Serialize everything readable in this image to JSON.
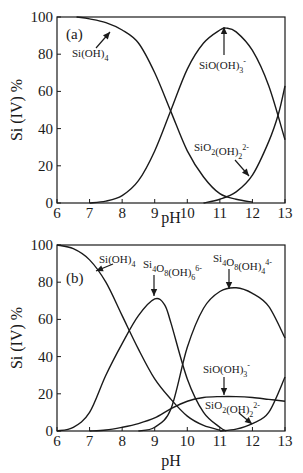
{
  "chart_data": [
    {
      "type": "line",
      "panel_label": "(a)",
      "xlabel": "pH",
      "ylabel": "Si (IV) %",
      "xlim": [
        6,
        13
      ],
      "ylim": [
        0,
        100
      ],
      "xticks": [
        "6",
        "7",
        "8",
        "9",
        "10",
        "11",
        "12",
        "13"
      ],
      "yticks": [
        "0",
        "20",
        "40",
        "60",
        "80",
        "100"
      ],
      "series": [
        {
          "name": "Si(OH)4",
          "label_parts": [
            [
              "Si(OH)",
              ""
            ],
            [
              "4",
              "sub"
            ]
          ],
          "x": [
            6.6,
            7,
            7.5,
            8,
            8.5,
            9,
            9.5,
            10,
            10.5,
            11,
            11.5,
            12
          ],
          "values": [
            100,
            99,
            97,
            93,
            86,
            70,
            49,
            28,
            14,
            5,
            2,
            0.5
          ]
        },
        {
          "name": "SiO(OH)3-",
          "label_parts": [
            [
              "SiO(OH)",
              ""
            ],
            [
              "3",
              "sub"
            ],
            [
              "-",
              "sup"
            ]
          ],
          "x": [
            7,
            7.5,
            8,
            8.5,
            9,
            9.5,
            10,
            10.5,
            11,
            11.2,
            11.5,
            12,
            12.5,
            13
          ],
          "values": [
            0,
            1,
            4,
            12,
            28,
            50,
            72,
            86,
            93,
            94,
            92,
            82,
            63,
            34
          ]
        },
        {
          "name": "SiO2(OH)2 2-",
          "label_parts": [
            [
              "SiO",
              ""
            ],
            [
              "2",
              "sub"
            ],
            [
              "(OH)",
              ""
            ],
            [
              "2",
              "sub"
            ],
            [
              "2-",
              "sup"
            ]
          ],
          "x": [
            10.5,
            11,
            11.5,
            12,
            12.5,
            12.8,
            13
          ],
          "values": [
            0,
            2,
            6,
            15,
            33,
            48,
            63
          ]
        }
      ]
    },
    {
      "type": "line",
      "panel_label": "(b)",
      "xlabel": "pH",
      "ylabel": "Si (IV) %",
      "xlim": [
        6,
        13
      ],
      "ylim": [
        0,
        100
      ],
      "xticks": [
        "6",
        "7",
        "8",
        "9",
        "10",
        "11",
        "12",
        "13"
      ],
      "yticks": [
        "0",
        "20",
        "40",
        "60",
        "80",
        "100"
      ],
      "series": [
        {
          "name": "Si(OH)4",
          "label_parts": [
            [
              "Si(OH)",
              ""
            ],
            [
              "4",
              "sub"
            ]
          ],
          "x": [
            6,
            6.5,
            7,
            7.5,
            8,
            8.5,
            9,
            9.5,
            10,
            10.5,
            11
          ],
          "values": [
            100,
            98,
            92,
            80,
            62,
            44,
            28,
            17,
            8,
            3,
            0.5
          ]
        },
        {
          "name": "Si4O8(OH)6 6-",
          "label_parts": [
            [
              "Si",
              ""
            ],
            [
              "4",
              "sub"
            ],
            [
              "O",
              ""
            ],
            [
              "8",
              "sub"
            ],
            [
              "(OH)",
              ""
            ],
            [
              "6",
              "sub"
            ],
            [
              "6-",
              "sup"
            ]
          ],
          "x": [
            6,
            6.5,
            7,
            7.5,
            8,
            8.5,
            9,
            9.3,
            9.5,
            10,
            10.5,
            11,
            11.2
          ],
          "values": [
            0,
            2,
            10,
            30,
            47,
            62,
            71,
            68,
            58,
            28,
            10,
            2,
            0
          ]
        },
        {
          "name": "Si4O8(OH)4 4-",
          "label_parts": [
            [
              "Si",
              ""
            ],
            [
              "4",
              "sub"
            ],
            [
              "O",
              ""
            ],
            [
              "8",
              "sub"
            ],
            [
              "(OH)",
              ""
            ],
            [
              "4",
              "sub"
            ],
            [
              "4-",
              "sup"
            ]
          ],
          "x": [
            8.5,
            9,
            9.5,
            10,
            10.5,
            11,
            11.5,
            12,
            12.5,
            13
          ],
          "values": [
            0,
            2,
            12,
            45,
            66,
            75,
            77,
            74,
            67,
            50
          ]
        },
        {
          "name": "SiO(OH)3-",
          "label_parts": [
            [
              "SiO(OH)",
              ""
            ],
            [
              "3",
              "sub"
            ],
            [
              "-",
              "sup"
            ]
          ],
          "x": [
            7,
            7.5,
            8,
            8.5,
            9,
            9.5,
            10,
            10.5,
            11,
            11.5,
            12,
            12.5,
            13
          ],
          "values": [
            0,
            0.5,
            2,
            4,
            7,
            12,
            16,
            18,
            18.5,
            18.5,
            18,
            17,
            16
          ]
        },
        {
          "name": "SiO2(OH)2 2-",
          "label_parts": [
            [
              "SiO",
              ""
            ],
            [
              "2",
              "sub"
            ],
            [
              "(OH)",
              ""
            ],
            [
              "2",
              "sub"
            ],
            [
              "2-",
              "sup"
            ]
          ],
          "x": [
            11,
            11.5,
            12,
            12.5,
            13
          ],
          "values": [
            0,
            1,
            4,
            10,
            29
          ]
        }
      ]
    }
  ]
}
